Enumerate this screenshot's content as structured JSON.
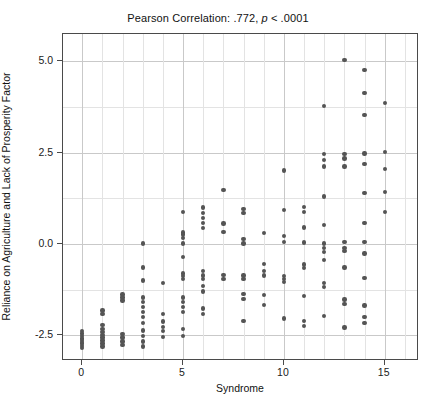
{
  "chart_data": {
    "type": "scatter",
    "title": "Pearson Correlation: .772, p < .0001",
    "title_parts": {
      "prefix": "Pearson Correlation: .772,",
      "italic": "p",
      "suffix": "< .0001"
    },
    "statistics": {
      "pearson_r": 0.772,
      "p_value_label": "< .0001"
    },
    "xlabel": "Syndrome",
    "ylabel": "Reliance on Agriculture and Lack of Prosperity Factor",
    "xlim": [
      -0.95,
      16.7
    ],
    "ylim": [
      -3.2,
      5.75
    ],
    "xticks": [
      0,
      5,
      10,
      15
    ],
    "xtick_labels": [
      "0",
      "5",
      "10",
      "15"
    ],
    "yticks": [
      -2.5,
      0.0,
      2.5,
      5.0
    ],
    "ytick_labels": [
      "-2.5",
      "0.0",
      "2.5",
      "5.0"
    ],
    "x_minor_step": 1,
    "y_minor_step": 1.25,
    "grid": true,
    "legend": null,
    "marker": {
      "shape": "circle",
      "color": "#545454",
      "size_px": 4.4
    },
    "points": [
      [
        0,
        -2.38
      ],
      [
        0,
        -2.45
      ],
      [
        0,
        -2.52
      ],
      [
        0,
        -2.58
      ],
      [
        0,
        -2.62
      ],
      [
        0,
        -2.68
      ],
      [
        0,
        -2.72
      ],
      [
        0,
        -2.78
      ],
      [
        0,
        -2.84
      ],
      [
        1,
        -1.82
      ],
      [
        1,
        -1.92
      ],
      [
        1,
        -2.22
      ],
      [
        1,
        -2.32
      ],
      [
        1,
        -2.4
      ],
      [
        1,
        -2.48
      ],
      [
        1,
        -2.56
      ],
      [
        1,
        -2.64
      ],
      [
        1,
        -2.72
      ],
      [
        1,
        -2.8
      ],
      [
        2,
        -1.38
      ],
      [
        2,
        -1.46
      ],
      [
        2,
        -1.54
      ],
      [
        2,
        -2.46
      ],
      [
        2,
        -2.56
      ],
      [
        2,
        -2.66
      ],
      [
        2,
        -2.76
      ],
      [
        3,
        0.02
      ],
      [
        3,
        -0.64
      ],
      [
        3,
        -1.0
      ],
      [
        3,
        -1.46
      ],
      [
        3,
        -1.58
      ],
      [
        3,
        -1.72
      ],
      [
        3,
        -1.86
      ],
      [
        3,
        -2.0
      ],
      [
        3,
        -2.16
      ],
      [
        3,
        -2.36
      ],
      [
        3,
        -2.52
      ],
      [
        3,
        -2.66
      ],
      [
        3,
        -2.8
      ],
      [
        4,
        -1.06
      ],
      [
        4,
        -1.92
      ],
      [
        4,
        -2.12
      ],
      [
        4,
        -2.26
      ],
      [
        4,
        -2.38
      ],
      [
        4,
        -2.54
      ],
      [
        5,
        0.88
      ],
      [
        5,
        0.32
      ],
      [
        5,
        0.26
      ],
      [
        5,
        0.16
      ],
      [
        5,
        0.02
      ],
      [
        5,
        -0.36
      ],
      [
        5,
        -0.8
      ],
      [
        5,
        -0.88
      ],
      [
        5,
        -0.96
      ],
      [
        5,
        -1.46
      ],
      [
        5,
        -1.58
      ],
      [
        5,
        -1.72
      ],
      [
        5,
        -1.86
      ],
      [
        5,
        -2.32
      ],
      [
        5,
        -2.52
      ],
      [
        6,
        1.0
      ],
      [
        6,
        0.86
      ],
      [
        6,
        0.72
      ],
      [
        6,
        0.58
      ],
      [
        6,
        0.44
      ],
      [
        6,
        -0.74
      ],
      [
        6,
        -0.86
      ],
      [
        6,
        -0.96
      ],
      [
        6,
        -1.14
      ],
      [
        6,
        -1.3
      ],
      [
        6,
        -1.76
      ],
      [
        6,
        -1.92
      ],
      [
        7,
        1.48
      ],
      [
        7,
        0.56
      ],
      [
        7,
        0.34
      ],
      [
        7,
        -0.84
      ],
      [
        7,
        -0.96
      ],
      [
        8,
        0.96
      ],
      [
        8,
        0.86
      ],
      [
        8,
        0.14
      ],
      [
        8,
        0.02
      ],
      [
        8,
        -0.86
      ],
      [
        8,
        -0.96
      ],
      [
        8,
        -1.36
      ],
      [
        8,
        -1.5
      ],
      [
        8,
        -2.1
      ],
      [
        9,
        0.3
      ],
      [
        9,
        -0.54
      ],
      [
        9,
        -0.74
      ],
      [
        9,
        -0.86
      ],
      [
        9,
        -1.4
      ],
      [
        9,
        -1.66
      ],
      [
        10,
        2.02
      ],
      [
        10,
        0.94
      ],
      [
        10,
        0.22
      ],
      [
        10,
        0.06
      ],
      [
        10,
        -0.88
      ],
      [
        10,
        -0.96
      ],
      [
        10,
        -1.04
      ],
      [
        10,
        -2.04
      ],
      [
        11,
        1.02
      ],
      [
        11,
        0.88
      ],
      [
        11,
        0.46
      ],
      [
        11,
        0.04
      ],
      [
        11,
        -0.56
      ],
      [
        11,
        -0.66
      ],
      [
        11,
        -1.42
      ],
      [
        11,
        -2.1
      ],
      [
        11,
        -2.24
      ],
      [
        12,
        3.78
      ],
      [
        12,
        2.46
      ],
      [
        12,
        2.3
      ],
      [
        12,
        2.12
      ],
      [
        12,
        1.3
      ],
      [
        12,
        0.52
      ],
      [
        12,
        0.02
      ],
      [
        12,
        -0.1
      ],
      [
        12,
        -0.22
      ],
      [
        12,
        -0.44
      ],
      [
        12,
        -1.06
      ],
      [
        12,
        -1.18
      ],
      [
        12,
        -1.96
      ],
      [
        13,
        5.04
      ],
      [
        13,
        2.46
      ],
      [
        13,
        2.34
      ],
      [
        13,
        2.12
      ],
      [
        13,
        0.06
      ],
      [
        13,
        -0.1
      ],
      [
        13,
        -0.18
      ],
      [
        13,
        -0.64
      ],
      [
        13,
        -1.52
      ],
      [
        13,
        -1.64
      ],
      [
        13,
        -2.28
      ],
      [
        14,
        4.76
      ],
      [
        14,
        4.14
      ],
      [
        14,
        3.54
      ],
      [
        14,
        2.48
      ],
      [
        14,
        2.2
      ],
      [
        14,
        1.4
      ],
      [
        14,
        0.58
      ],
      [
        14,
        0.06
      ],
      [
        14,
        -0.26
      ],
      [
        14,
        -0.92
      ],
      [
        14,
        -1.68
      ],
      [
        14,
        -2.0
      ],
      [
        14,
        -2.16
      ],
      [
        15,
        3.86
      ],
      [
        15,
        2.52
      ],
      [
        15,
        2.06
      ],
      [
        15,
        1.42
      ],
      [
        15,
        0.88
      ]
    ]
  }
}
